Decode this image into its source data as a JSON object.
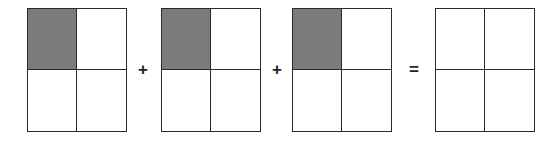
{
  "figure": {
    "shade_color": "#7b7b7b",
    "line_color": "#2a2a2a",
    "operands": [
      {
        "grid": "2x2",
        "shaded_cells": [
          "top-left"
        ],
        "fraction_shown": "1/4"
      },
      {
        "grid": "2x2",
        "shaded_cells": [
          "top-left"
        ],
        "fraction_shown": "1/4"
      },
      {
        "grid": "2x2",
        "shaded_cells": [
          "top-left"
        ],
        "fraction_shown": "1/4"
      }
    ],
    "result": {
      "grid": "2x2",
      "shaded_cells": []
    },
    "operators": [
      "+",
      "+",
      "="
    ]
  }
}
